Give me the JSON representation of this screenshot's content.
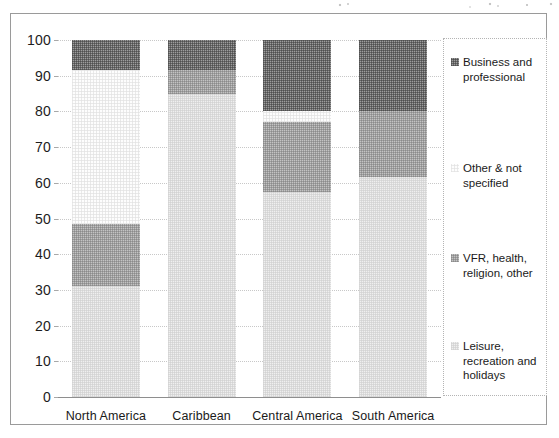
{
  "chart_data": {
    "type": "bar",
    "subtype": "stacked-bar-100",
    "title": "",
    "subtitle": "",
    "xlabel": "",
    "ylabel": "",
    "grid": true,
    "legend_position": "right",
    "ylim": [
      0,
      100
    ],
    "ytick_labels": [
      "100",
      "90",
      "80",
      "70",
      "60",
      "50",
      "40",
      "30",
      "20",
      "10",
      "0"
    ],
    "ytick_values": [
      100,
      90,
      80,
      70,
      60,
      50,
      40,
      30,
      20,
      10,
      0
    ],
    "categories": [
      "North America",
      "Caribbean",
      "Central America",
      "South America"
    ],
    "stack_order_bottom_to_top": [
      "Leisure, recreation and holidays",
      "VFR, health, religion, other",
      "Other & not specified",
      "Business and professional"
    ],
    "series": [
      {
        "name": "Leisure, recreation and holidays",
        "color": "#efefef",
        "values": [
          31,
          85,
          57.5,
          61.5
        ]
      },
      {
        "name": "VFR, health, religion, other",
        "color": "#c3c3c3",
        "values": [
          17.5,
          6.5,
          19.5,
          18.5
        ]
      },
      {
        "name": "Other & not specified",
        "color": "#fdfdfd",
        "values": [
          43,
          0,
          3,
          0
        ]
      },
      {
        "name": "Business and professional",
        "color": "#9d9d9d",
        "values": [
          8.5,
          8.5,
          20,
          20
        ]
      }
    ],
    "cumulative_tops": {
      "North America": [
        31,
        48.5,
        91.5,
        100
      ],
      "Caribbean": [
        85,
        91.5,
        91.5,
        100
      ],
      "Central America": [
        57.5,
        77,
        80,
        100
      ],
      "South America": [
        61.5,
        80,
        80,
        100
      ]
    }
  },
  "legend": {
    "entries": [
      {
        "label": "Business and\nprofessional",
        "swatch": "business-swatch"
      },
      {
        "label": "Other & not\nspecified",
        "swatch": "other-swatch"
      },
      {
        "label": "VFR, health,\nreligion, other",
        "swatch": "vfr-swatch"
      },
      {
        "label": "Leisure,\nrecreation and\nholidays",
        "swatch": "leisure-swatch"
      }
    ]
  }
}
